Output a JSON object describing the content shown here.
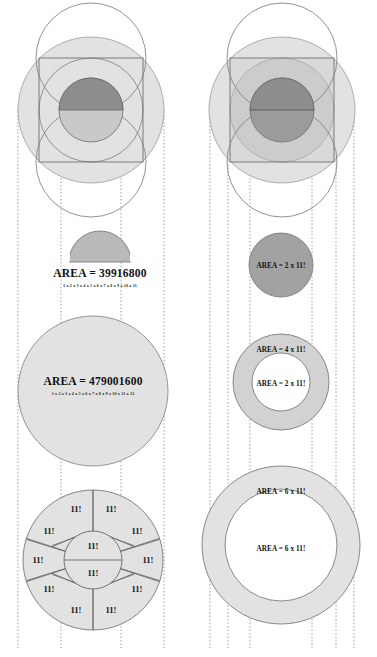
{
  "figure": {
    "title_visible": false,
    "background": "#ffffff",
    "colors": {
      "light_gray": "#e2e2e2",
      "mid_gray": "#b9b9b9",
      "dark_gray": "#8d8d8d",
      "deeper_gray": "#a2a2a2",
      "stroke": "#7d7d7d",
      "stroke_dark": "#5f5f5f",
      "guide_line": "#9a9a9a",
      "text": "#111111",
      "white": "#ffffff"
    }
  },
  "left_column": {
    "top_construction": {
      "name": "circle-square-vesica-construction"
    },
    "half_circle_label": {
      "area_text": "AREA = 39916800",
      "expansion_text": "1 x 2 x 3 x 4 x 5 x 6 x 7 x 8 x 9 x 10 x 11"
    },
    "big_circle_label": {
      "area_text": "AREA = 479001600",
      "expansion_text": "1 x 2 x 3 x 4 x 5 x 6 x 7 x 8 x 9 x 10 x 11 x 12"
    },
    "wheel": {
      "outer_wedge_count": 10,
      "inner_wedge_count": 2,
      "total_wedges": 12,
      "wedge_label": "11!",
      "outer_labels": [
        "11!",
        "11!",
        "11!",
        "11!",
        "11!",
        "11!",
        "11!",
        "11!",
        "11!",
        "11!"
      ],
      "inner_labels": [
        "11!",
        "11!"
      ]
    }
  },
  "right_column": {
    "top_construction": {
      "name": "circle-square-vesica-construction-shaded"
    },
    "disc_label": {
      "area_text": "AREA = 2 x 11!"
    },
    "annulus_small": {
      "ring_text": "AREA = 4 x 11!",
      "inner_text": "AREA = 2 x 11!"
    },
    "annulus_large": {
      "ring_text": "AREA = 6 x 11!",
      "inner_text": "AREA = 6 x 11!"
    }
  },
  "guides": {
    "left_x": [
      18,
      61,
      121,
      164
    ],
    "right_x": [
      210,
      228,
      250,
      312,
      336,
      354
    ]
  }
}
